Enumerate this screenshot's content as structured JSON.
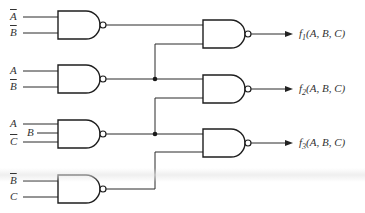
{
  "diagram": {
    "type": "logic-circuit",
    "gate_type": "NAND",
    "input_gates": [
      {
        "id": "g1",
        "inputs": [
          {
            "var": "A",
            "complemented": true
          },
          {
            "var": "B",
            "complemented": true
          }
        ]
      },
      {
        "id": "g2",
        "inputs": [
          {
            "var": "A",
            "complemented": false
          },
          {
            "var": "B",
            "complemented": true
          }
        ]
      },
      {
        "id": "g3",
        "inputs": [
          {
            "var": "A",
            "complemented": false
          },
          {
            "var": "B",
            "complemented": false
          },
          {
            "var": "C",
            "complemented": true
          }
        ]
      },
      {
        "id": "g4",
        "inputs": [
          {
            "var": "B",
            "complemented": true
          },
          {
            "var": "C",
            "complemented": false
          }
        ]
      }
    ],
    "output_gates": [
      {
        "id": "o1",
        "inputs": [
          "g1",
          "g2"
        ],
        "label_fn": "f",
        "label_sub": "1",
        "label_args": "(A, B, C)"
      },
      {
        "id": "o2",
        "inputs": [
          "g2",
          "g3"
        ],
        "label_fn": "f",
        "label_sub": "2",
        "label_args": "(A, B, C)"
      },
      {
        "id": "o3",
        "inputs": [
          "g3",
          "g4"
        ],
        "label_fn": "f",
        "label_sub": "3",
        "label_args": "(A, B, C)"
      }
    ],
    "labels": {
      "g1_in1": "A",
      "g1_in2": "B",
      "g2_in1": "A",
      "g2_in2": "B",
      "g3_in1": "A",
      "g3_in2": "B",
      "g3_in3": "C",
      "g4_in1": "B",
      "g4_in2": "C"
    }
  }
}
